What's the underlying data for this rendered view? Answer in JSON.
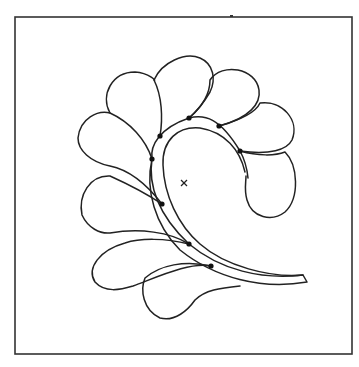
{
  "diagram": {
    "frame": {
      "x": 15,
      "y": 17,
      "width": 337,
      "height": 337,
      "top_tick_x": 231
    },
    "stroke_color": "#222222",
    "background": "#ffffff",
    "center_marker": {
      "glyph": "×",
      "x": 184,
      "y": 183
    },
    "nodes": [
      {
        "x": 189,
        "y": 118
      },
      {
        "x": 219,
        "y": 126
      },
      {
        "x": 240,
        "y": 151
      },
      {
        "x": 160,
        "y": 136
      },
      {
        "x": 152,
        "y": 159
      },
      {
        "x": 162,
        "y": 204
      },
      {
        "x": 189,
        "y": 244
      },
      {
        "x": 211,
        "y": 266
      }
    ],
    "leaf_count": 9,
    "stem": "curved double-line spine ending at lower right"
  }
}
